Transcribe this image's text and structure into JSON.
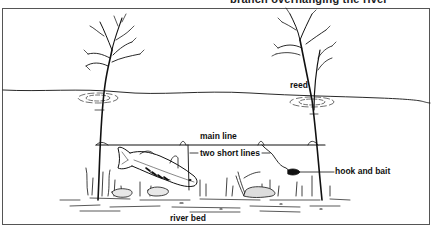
{
  "diagram": {
    "title": "branch overhanging the river",
    "labels": {
      "reed": "reed",
      "main_line": "main line",
      "two_short_lines": "two short lines",
      "hook_and_bait": "hook and bait",
      "river_bed": "river bed"
    },
    "colors": {
      "ink": "#111111",
      "frame": "#555555",
      "background": "#ffffff"
    }
  }
}
